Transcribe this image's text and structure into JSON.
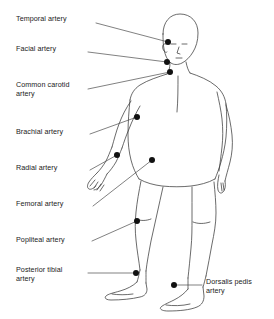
{
  "figure": {
    "stroke_color": "#3a3a3a",
    "dot_color": "#111111",
    "leader_color": "#4a4a4a",
    "background_color": "#ffffff"
  },
  "labels": [
    {
      "id": "temporal",
      "text": "Temporal artery",
      "x": 16,
      "y": 18,
      "lines": 1,
      "leader_from": [
        96,
        23
      ],
      "leader_to": [
        168,
        42
      ],
      "dot": [
        168,
        42
      ]
    },
    {
      "id": "facial",
      "text": "Facial artery",
      "x": 16,
      "y": 48,
      "lines": 1,
      "leader_from": [
        88,
        52
      ],
      "leader_to": [
        167,
        62
      ],
      "dot": [
        167,
        62
      ]
    },
    {
      "id": "common-carotid",
      "text": "Common carotid\nartery",
      "x": 16,
      "y": 84,
      "lines": 2,
      "leader_from": [
        88,
        89
      ],
      "leader_to": [
        170,
        72
      ],
      "dot": [
        170,
        72
      ]
    },
    {
      "id": "brachial",
      "text": "Brachial artery",
      "x": 16,
      "y": 131,
      "lines": 1,
      "leader_from": [
        90,
        134
      ],
      "leader_to": [
        137,
        117
      ],
      "dot": [
        137,
        117
      ]
    },
    {
      "id": "radial",
      "text": "Radial artery",
      "x": 16,
      "y": 167,
      "lines": 1,
      "leader_from": [
        90,
        170
      ],
      "leader_to": [
        117,
        155
      ],
      "dot": [
        117,
        155
      ]
    },
    {
      "id": "femoral",
      "text": "Femoral artery",
      "x": 16,
      "y": 203,
      "lines": 1,
      "leader_from": [
        93,
        206
      ],
      "leader_to": [
        152,
        160
      ],
      "dot": [
        152,
        160
      ]
    },
    {
      "id": "popliteal",
      "text": "Popliteal artery",
      "x": 16,
      "y": 239,
      "lines": 1,
      "leader_from": [
        92,
        241
      ],
      "leader_to": [
        137,
        221
      ],
      "dot": [
        137,
        221
      ]
    },
    {
      "id": "posterior-tibial",
      "text": "Posterior tibial\nartery",
      "x": 16,
      "y": 269,
      "lines": 2,
      "leader_from": [
        88,
        273
      ],
      "leader_to": [
        136,
        273
      ],
      "dot": [
        136,
        273
      ]
    },
    {
      "id": "dorsalis-pedis",
      "text": "Dorsalis pedis\nartery",
      "x": 206,
      "y": 281,
      "lines": 2,
      "leader_from": [
        202,
        285
      ],
      "leader_to": [
        174,
        285
      ],
      "dot": [
        174,
        285
      ]
    }
  ]
}
